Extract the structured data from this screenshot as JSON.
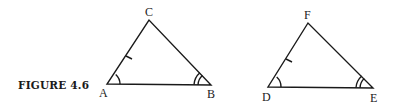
{
  "caption": "FIGURE 4.6",
  "triangles": [
    {
      "name": "ABC",
      "vertices": {
        "A": {
          "label": "A",
          "x": 107,
          "y": 84
        },
        "B": {
          "label": "B",
          "x": 211,
          "y": 85
        },
        "C": {
          "label": "C",
          "x": 149,
          "y": 20
        }
      },
      "marks": {
        "tick_side": "AC",
        "single_arc_angle": "A",
        "double_arc_angle": "B"
      }
    },
    {
      "name": "DEF",
      "vertices": {
        "D": {
          "label": "D",
          "x": 268,
          "y": 87
        },
        "E": {
          "label": "E",
          "x": 373,
          "y": 88
        },
        "F": {
          "label": "F",
          "x": 308,
          "y": 23
        }
      },
      "marks": {
        "tick_side": "DF",
        "single_arc_angle": "D",
        "double_arc_angle": "E"
      }
    }
  ],
  "colors": {
    "stroke": "#1a1a1a",
    "background": "#ffffff"
  }
}
